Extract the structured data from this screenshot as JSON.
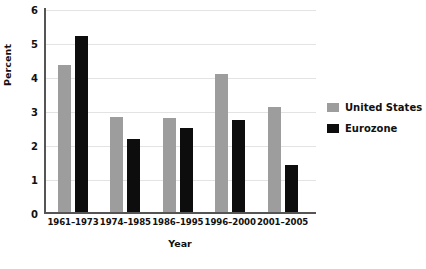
{
  "chart_data": {
    "type": "bar",
    "title": "",
    "subtitle": "",
    "xlabel": "Year",
    "ylabel": "Percent",
    "categories": [
      "1961–1973",
      "1974–1985",
      "1986–1995",
      "1996–2000",
      "2001–2005"
    ],
    "series": [
      {
        "name": "United States",
        "color": "#9d9d9d",
        "values": [
          4.35,
          2.8,
          2.78,
          4.08,
          3.1
        ]
      },
      {
        "name": "Eurozone",
        "color": "#0d0d0d",
        "values": [
          5.2,
          2.15,
          2.48,
          2.72,
          1.4
        ]
      }
    ],
    "ylim": [
      0,
      6
    ],
    "yticks": [
      0,
      1,
      2,
      3,
      4,
      5,
      6
    ],
    "ytick_labels": [
      "0",
      "1",
      "2",
      "3",
      "4",
      "5",
      "6"
    ],
    "grid": "horizontal",
    "legend_position": "right",
    "annotations": []
  },
  "axes": {
    "y_title": "Percent",
    "x_title": "Year"
  },
  "legend": {
    "entries": [
      {
        "label": "United States",
        "color": "#9d9d9d"
      },
      {
        "label": "Eurozone",
        "color": "#0d0d0d"
      }
    ]
  }
}
